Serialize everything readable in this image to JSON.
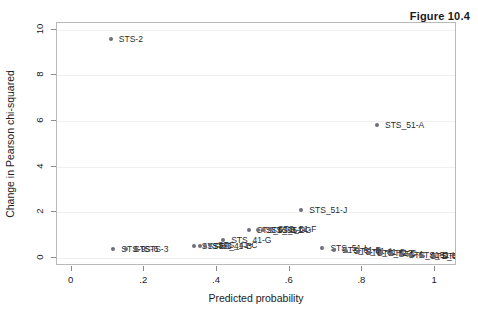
{
  "figure": {
    "title": "Figure 10.4"
  },
  "chart_data": {
    "type": "scatter",
    "title": "Figure 10.4",
    "xlabel": "Predicted probability",
    "ylabel": "Change in Pearson chi-squared",
    "xlim": [
      -0.04,
      1.06
    ],
    "ylim": [
      -0.35,
      10.3
    ],
    "xticks": [
      0,
      0.2,
      0.4,
      0.6,
      0.8,
      1
    ],
    "xticklabels": [
      "0",
      ".2",
      ".4",
      ".6",
      ".8",
      "1"
    ],
    "yticks": [
      0,
      2,
      4,
      6,
      8,
      10
    ],
    "yticklabels": [
      "0",
      "2",
      "4",
      "6",
      "8",
      "10"
    ],
    "grid": "horizontal",
    "legend": "none",
    "marker_color": "#6e6e7a",
    "frame_color": "#b9b9b9",
    "points": [
      {
        "label": "STS-2",
        "x": 0.108,
        "y": 9.6,
        "lx": 8,
        "ly": 0
      },
      {
        "label": "STS_51-A",
        "x": 0.84,
        "y": 5.85,
        "lx": 8,
        "ly": 0
      },
      {
        "label": "STS_51-J",
        "x": 0.632,
        "y": 2.1,
        "lx": 8,
        "ly": 0
      },
      {
        "label": "STS_51-B",
        "x": 0.487,
        "y": 1.21,
        "lx": 8,
        "ly": 0
      },
      {
        "label": "STS_51-D",
        "x": 0.512,
        "y": 1.24,
        "lx": 8,
        "ly": 0
      },
      {
        "label": "STS_51-G",
        "x": 0.527,
        "y": 1.23,
        "lx": 8,
        "ly": 0
      },
      {
        "label": "STS_51-F",
        "x": 0.545,
        "y": 1.26,
        "lx": 8,
        "ly": 0
      },
      {
        "label": "STS_41-G",
        "x": 0.417,
        "y": 0.78,
        "lx": 8,
        "ly": 0
      },
      {
        "label": "STS-8",
        "x": 0.336,
        "y": 0.52,
        "lx": 8,
        "ly": 0
      },
      {
        "label": "STS-5",
        "x": 0.352,
        "y": 0.54,
        "lx": 8,
        "ly": 0
      },
      {
        "label": "STS_41-B",
        "x": 0.366,
        "y": 0.53,
        "lx": 8,
        "ly": 0
      },
      {
        "label": "STS_41-C",
        "x": 0.38,
        "y": 0.55,
        "lx": 8,
        "ly": 0
      },
      {
        "label": "STS-9",
        "x": 0.115,
        "y": 0.4,
        "lx": 8,
        "ly": 0
      },
      {
        "label": "STS-6",
        "x": 0.15,
        "y": 0.41,
        "lx": 8,
        "ly": 0
      },
      {
        "label": "STS-3",
        "x": 0.178,
        "y": 0.4,
        "lx": 8,
        "ly": 0
      },
      {
        "label": "STS_51-I",
        "x": 0.69,
        "y": 0.42,
        "lx": 8,
        "ly": 0
      },
      {
        "label": "STS_61-B",
        "x": 0.722,
        "y": 0.36,
        "lx": 8,
        "ly": 0
      },
      {
        "label": "STS_61-A",
        "x": 0.755,
        "y": 0.31,
        "lx": 8,
        "ly": 0
      },
      {
        "label": "STS_61-C",
        "x": 0.787,
        "y": 0.27,
        "lx": 8,
        "ly": 0
      },
      {
        "label": "STS_51-C",
        "x": 0.818,
        "y": 0.23,
        "lx": 8,
        "ly": 0
      },
      {
        "label": "STS-7",
        "x": 0.85,
        "y": 0.2,
        "lx": 8,
        "ly": 0
      },
      {
        "label": "STS-4",
        "x": 0.878,
        "y": 0.17,
        "lx": 8,
        "ly": 0
      },
      {
        "label": "STS_41-D",
        "x": 0.905,
        "y": 0.14,
        "lx": 8,
        "ly": 0
      },
      {
        "label": "STS_51-L",
        "x": 0.932,
        "y": 0.12,
        "lx": 8,
        "ly": 0
      },
      {
        "label": "STS_61-C",
        "x": 0.965,
        "y": 0.09,
        "lx": 8,
        "ly": 0
      },
      {
        "label": "STS_51-C",
        "x": 0.998,
        "y": 0.07,
        "lx": 8,
        "ly": 0
      }
    ]
  }
}
